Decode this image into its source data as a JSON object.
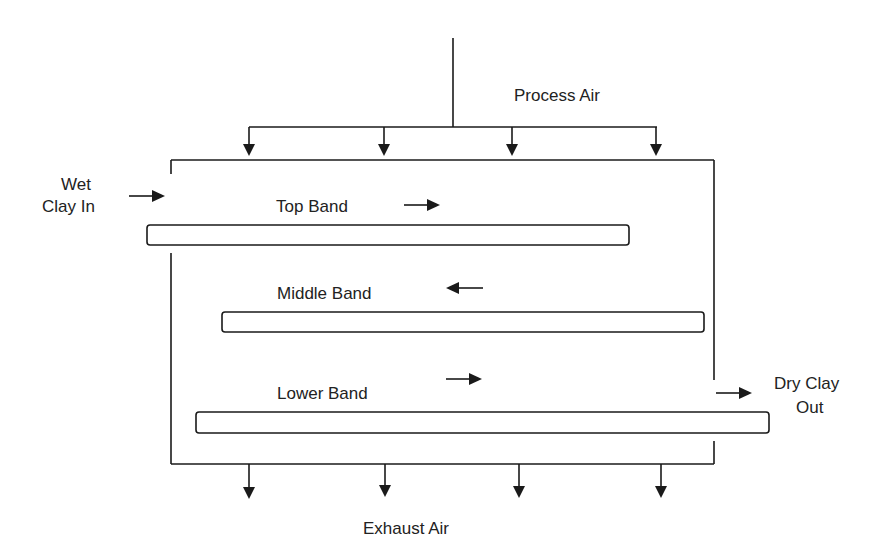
{
  "diagram": {
    "type": "process-flow",
    "labels": {
      "process_air": "Process Air",
      "exhaust_air": "Exhaust Air",
      "wet_clay_line1": "Wet",
      "wet_clay_line2": "Clay In",
      "dry_clay_line1": "Dry Clay",
      "dry_clay_line2": "Out",
      "top_band": "Top Band",
      "middle_band": "Middle Band",
      "lower_band": "Lower Band"
    },
    "bands": [
      {
        "name": "Top Band",
        "direction": "right"
      },
      {
        "name": "Middle Band",
        "direction": "left"
      },
      {
        "name": "Lower Band",
        "direction": "right"
      }
    ],
    "process_air_inlets": 4,
    "exhaust_air_outlets": 4,
    "colors": {
      "stroke": "#1a1a1a",
      "text": "#222222",
      "background": "#ffffff"
    }
  }
}
